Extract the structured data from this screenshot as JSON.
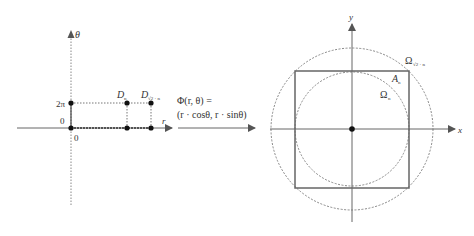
{
  "left_plot": {
    "axis_theta_label": "θ",
    "axis_r_label": "r",
    "tick_2pi": "2π",
    "tick_theta_0": "0",
    "tick_r_0": "0",
    "point_Dn": {
      "main": "D",
      "sub": "n"
    },
    "point_Dsqrt2n": {
      "main": "D",
      "sub": "√2 · n"
    }
  },
  "mapping": {
    "line1": "Φ(r, θ) =",
    "line2": "(r · cosθ, r · sinθ)"
  },
  "right_plot": {
    "axis_x_label": "x",
    "axis_y_label": "y",
    "outer_circle": {
      "main": "Ω",
      "sub": "√2 · n"
    },
    "square": {
      "main": "A",
      "sub": "n"
    },
    "inner_circle": {
      "main": "Ω",
      "sub": "n"
    }
  },
  "colors": {
    "axis": "#555555",
    "dotted": "#777777",
    "square": "#666666",
    "point": "#111111"
  }
}
